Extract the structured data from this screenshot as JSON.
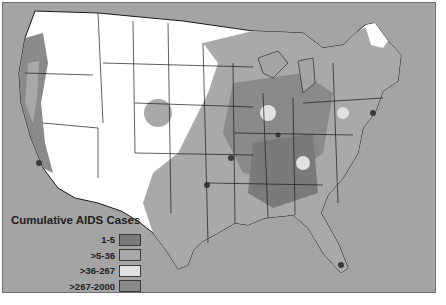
{
  "map": {
    "title": "Cumulative AIDS Cases",
    "region": "Contiguous United States",
    "colors": {
      "ocean": "#a4a4a4",
      "no_cases": "#ffffff",
      "state_border": "#1a1a1a"
    }
  },
  "legend": {
    "title": "Cumulative AIDS Cases",
    "items": [
      {
        "label": "1-5",
        "color": "#7a7a7a"
      },
      {
        "label": ">5-36",
        "color": "#a9a9a9"
      },
      {
        "label": ">36-267",
        "color": "#e2e2e2"
      },
      {
        "label": ">267-2000",
        "color": "#8a8a8a"
      },
      {
        "label": ">2000",
        "color": "#3c3c3c"
      }
    ]
  }
}
